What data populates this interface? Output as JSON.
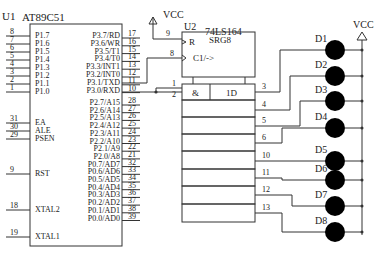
{
  "u1": {
    "ref": "U1",
    "part": "AT89C51",
    "left_pins": [
      {
        "num": "8",
        "name": "P1.7"
      },
      {
        "num": "7",
        "name": "P1.6"
      },
      {
        "num": "6",
        "name": "P1.5"
      },
      {
        "num": "5",
        "name": "P1.4"
      },
      {
        "num": "4",
        "name": "P1.3"
      },
      {
        "num": "3",
        "name": "P1.2"
      },
      {
        "num": "2",
        "name": "P1.1"
      },
      {
        "num": "1",
        "name": "P1.0"
      },
      {
        "num": "31",
        "name": "EA"
      },
      {
        "num": "30",
        "name": "ALE"
      },
      {
        "num": "29",
        "name": "PSEN"
      },
      {
        "num": "9",
        "name": "RST"
      },
      {
        "num": "18",
        "name": "XTAL2"
      },
      {
        "num": "19",
        "name": "XTAL1"
      }
    ],
    "right_pins": [
      {
        "num": "17",
        "name": "P3.7/RD"
      },
      {
        "num": "16",
        "name": "P3.6/WR"
      },
      {
        "num": "15",
        "name": "P3.5/T1"
      },
      {
        "num": "14",
        "name": "P3.4/T0"
      },
      {
        "num": "13",
        "name": "P3.3/INT1"
      },
      {
        "num": "12",
        "name": "P3.2/INT0"
      },
      {
        "num": "11",
        "name": "P3.1/TXD"
      },
      {
        "num": "10",
        "name": "P3.0/RXD"
      },
      {
        "num": "28",
        "name": "P2.7/A15"
      },
      {
        "num": "27",
        "name": "P2.6/A14"
      },
      {
        "num": "26",
        "name": "P2.5/A13"
      },
      {
        "num": "25",
        "name": "P2.4/A12"
      },
      {
        "num": "24",
        "name": "P2.3/A11"
      },
      {
        "num": "23",
        "name": "P2.2/A10"
      },
      {
        "num": "22",
        "name": "P2.1/A9"
      },
      {
        "num": "21",
        "name": "P2.0/A8"
      },
      {
        "num": "32",
        "name": "P0.7/AD7"
      },
      {
        "num": "33",
        "name": "P0.6/AD6"
      },
      {
        "num": "34",
        "name": "P0.5/AD5"
      },
      {
        "num": "35",
        "name": "P0.4/AD4"
      },
      {
        "num": "36",
        "name": "P0.3/AD3"
      },
      {
        "num": "37",
        "name": "P0.2/AD2"
      },
      {
        "num": "38",
        "name": "P0.1/AD1"
      },
      {
        "num": "39",
        "name": "P0.0/AD0"
      }
    ]
  },
  "u2": {
    "ref": "U2",
    "part": "74LS164",
    "block": "SRG8",
    "reset_label": "R",
    "clock_label": "C1/->",
    "and_label": "&",
    "data_label": "1D",
    "reset_pin": "9",
    "clock_pin": "8",
    "input_pins": [
      "1",
      "2"
    ],
    "output_pins": [
      "3",
      "4",
      "5",
      "6",
      "10",
      "11",
      "12",
      "13"
    ]
  },
  "power": {
    "vcc_u2": "VCC",
    "vcc_leds": "VCC"
  },
  "leds": [
    "D1",
    "D2",
    "D3",
    "D4",
    "D5",
    "D6",
    "D7",
    "D8"
  ]
}
